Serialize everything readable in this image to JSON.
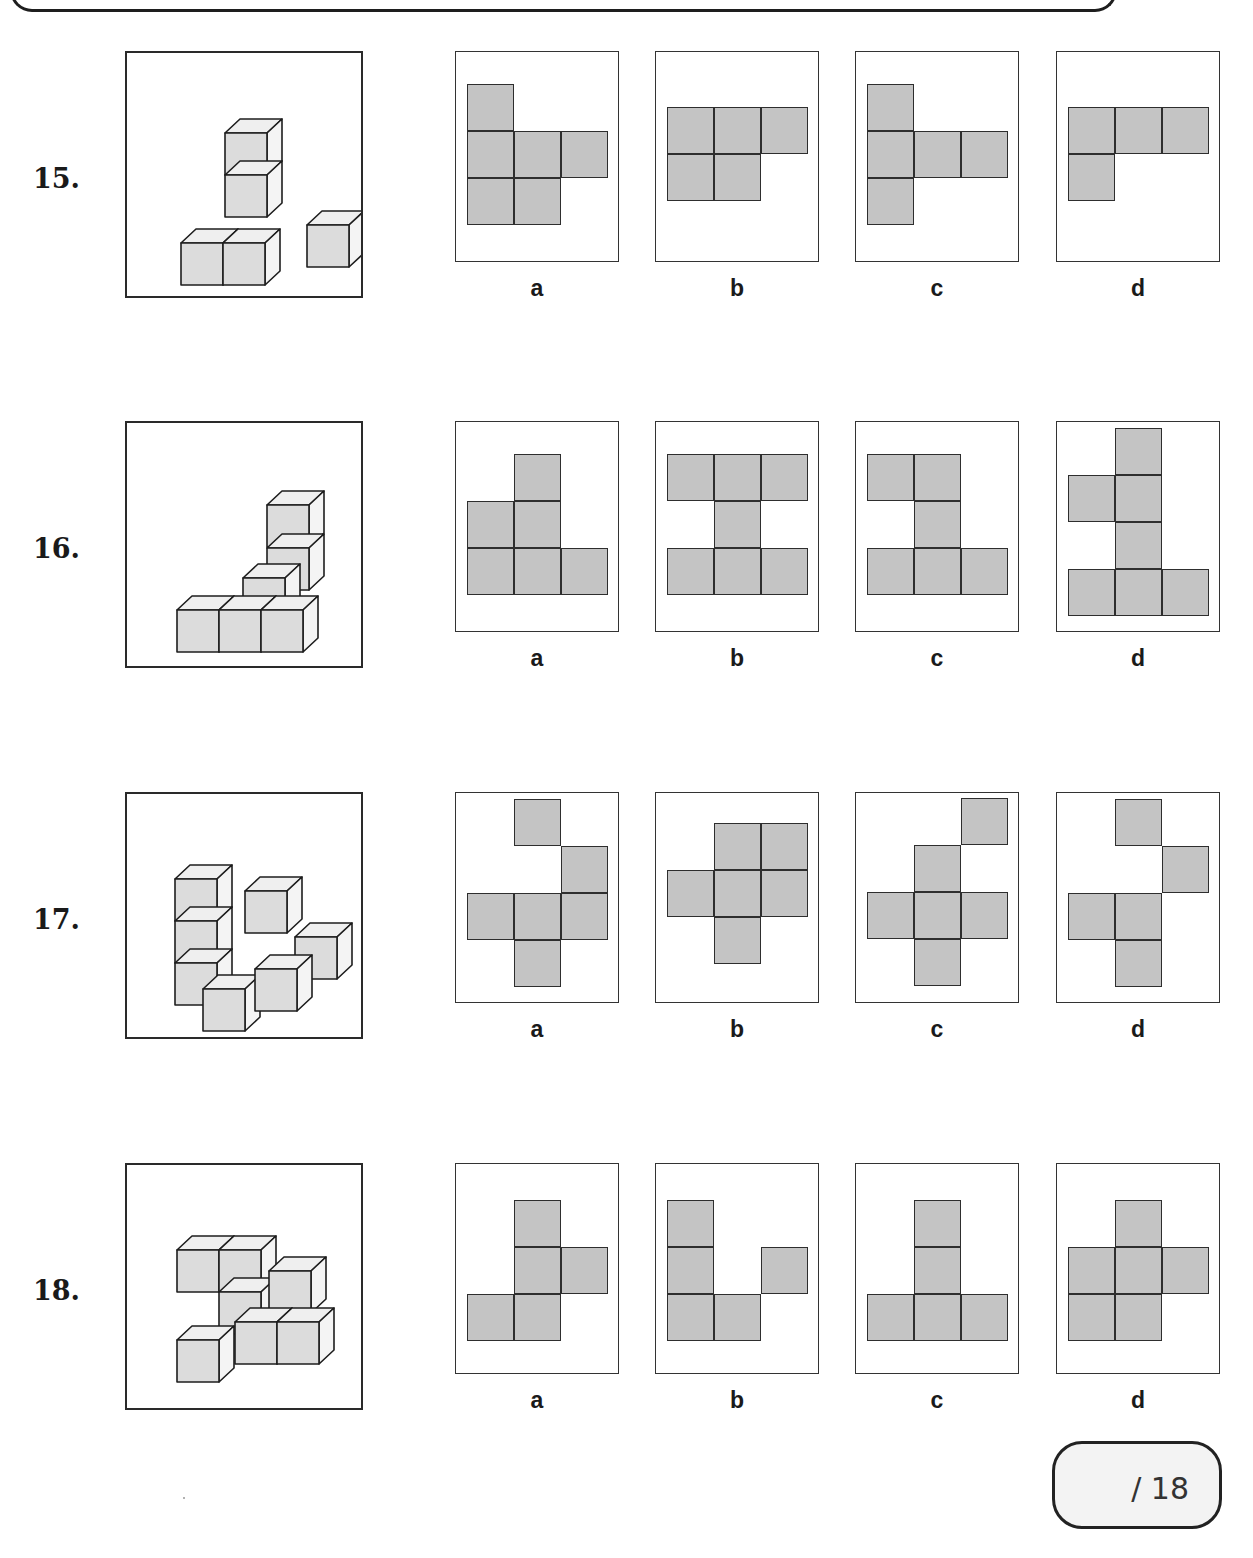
{
  "page": {
    "score": {
      "label": "/ 18"
    },
    "colors": {
      "net_fill": "#c4c4c4",
      "cube_front": "#dcdcdc",
      "cube_top": "#efefef",
      "cube_side": "#f4f4f4",
      "stroke": "#1e1e1e"
    }
  },
  "questions": [
    {
      "number": "15.",
      "figure": "3D cube structure: 2-cube vertical column on back-left, base row of 2 cubes in front, plus 1 cube to the back-right",
      "options": [
        {
          "label": "a",
          "cells": [
            [
              0,
              0
            ],
            [
              0,
              1
            ],
            [
              1,
              1
            ],
            [
              2,
              1
            ],
            [
              0,
              2
            ],
            [
              1,
              2
            ]
          ]
        },
        {
          "label": "b",
          "cells": [
            [
              0,
              0
            ],
            [
              1,
              0
            ],
            [
              2,
              0
            ],
            [
              0,
              1
            ],
            [
              1,
              1
            ]
          ]
        },
        {
          "label": "c",
          "cells": [
            [
              0,
              0
            ],
            [
              0,
              1
            ],
            [
              1,
              1
            ],
            [
              2,
              1
            ],
            [
              0,
              2
            ]
          ]
        },
        {
          "label": "d",
          "cells": [
            [
              0,
              0
            ],
            [
              1,
              0
            ],
            [
              2,
              0
            ],
            [
              0,
              1
            ]
          ]
        }
      ]
    },
    {
      "number": "16.",
      "figure": "3D cube structure: front row of 3 cubes, 2-cube tower in middle-back, cubes behind on both sides",
      "options": [
        {
          "label": "a",
          "cells": [
            [
              1,
              0
            ],
            [
              0,
              1
            ],
            [
              1,
              1
            ],
            [
              0,
              2
            ],
            [
              1,
              2
            ],
            [
              2,
              2
            ]
          ]
        },
        {
          "label": "b",
          "cells": [
            [
              0,
              0
            ],
            [
              1,
              0
            ],
            [
              2,
              0
            ],
            [
              1,
              1
            ],
            [
              0,
              2
            ],
            [
              1,
              2
            ],
            [
              2,
              2
            ]
          ]
        },
        {
          "label": "c",
          "cells": [
            [
              0,
              0
            ],
            [
              1,
              0
            ],
            [
              1,
              1
            ],
            [
              0,
              2
            ],
            [
              1,
              2
            ],
            [
              2,
              2
            ]
          ]
        },
        {
          "label": "d",
          "cells": [
            [
              1,
              0
            ],
            [
              0,
              1
            ],
            [
              1,
              1
            ],
            [
              1,
              2
            ],
            [
              0,
              3
            ],
            [
              1,
              3
            ],
            [
              2,
              3
            ]
          ]
        }
      ]
    },
    {
      "number": "17.",
      "figure": "3D cube structure: 3-cube column on left, 2-cube column in back-right, front row of cubes",
      "options": [
        {
          "label": "a",
          "cells": [
            [
              1,
              0
            ],
            [
              2,
              1
            ],
            [
              0,
              2
            ],
            [
              1,
              2
            ],
            [
              2,
              2
            ],
            [
              1,
              3
            ]
          ]
        },
        {
          "label": "b",
          "cells": [
            [
              1,
              0
            ],
            [
              2,
              0
            ],
            [
              0,
              1
            ],
            [
              1,
              1
            ],
            [
              2,
              1
            ],
            [
              1,
              2
            ]
          ]
        },
        {
          "label": "c",
          "cells": [
            [
              2,
              0
            ],
            [
              1,
              1
            ],
            [
              0,
              2
            ],
            [
              1,
              2
            ],
            [
              2,
              2
            ],
            [
              1,
              3
            ]
          ]
        },
        {
          "label": "d",
          "cells": [
            [
              1,
              0
            ],
            [
              2,
              1
            ],
            [
              0,
              2
            ],
            [
              1,
              2
            ],
            [
              1,
              3
            ]
          ]
        }
      ]
    },
    {
      "number": "18.",
      "figure": "3D cube structure: top row of 2 cubes, middle stacked cube, bottom row of cubes with back column",
      "options": [
        {
          "label": "a",
          "cells": [
            [
              1,
              0
            ],
            [
              1,
              1
            ],
            [
              2,
              1
            ],
            [
              0,
              2
            ],
            [
              1,
              2
            ]
          ]
        },
        {
          "label": "b",
          "cells": [
            [
              0,
              0
            ],
            [
              0,
              1
            ],
            [
              2,
              1
            ],
            [
              0,
              2
            ],
            [
              1,
              2
            ]
          ]
        },
        {
          "label": "c",
          "cells": [
            [
              1,
              0
            ],
            [
              1,
              1
            ],
            [
              0,
              2
            ],
            [
              1,
              2
            ],
            [
              2,
              2
            ]
          ]
        },
        {
          "label": "d",
          "cells": [
            [
              1,
              0
            ],
            [
              0,
              1
            ],
            [
              1,
              1
            ],
            [
              2,
              1
            ],
            [
              0,
              2
            ],
            [
              1,
              2
            ]
          ]
        }
      ]
    }
  ]
}
